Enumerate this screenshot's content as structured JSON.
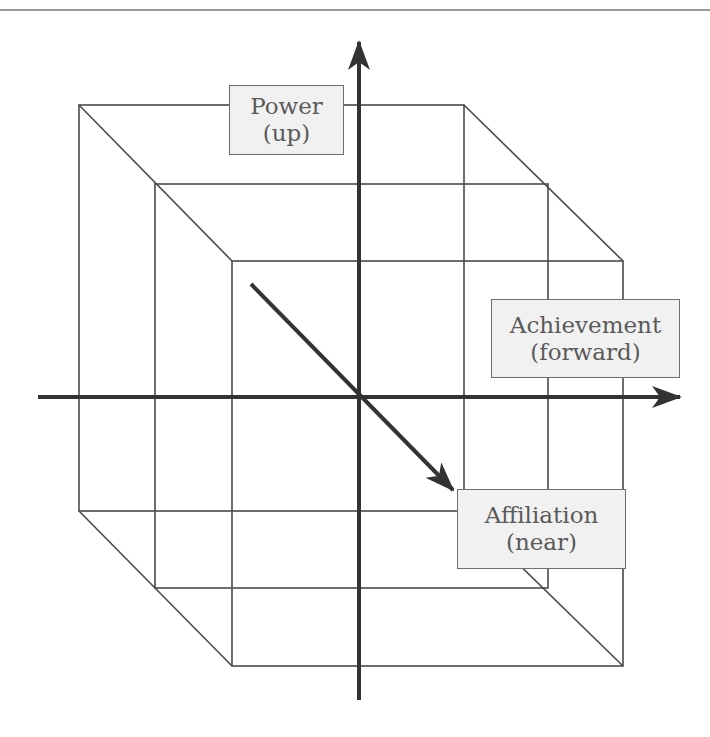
{
  "header": {
    "text": ""
  },
  "diagram": {
    "title": "",
    "axes": [
      {
        "id": "power",
        "label": "Power",
        "direction": "(up)"
      },
      {
        "id": "achievement",
        "label": "Achievement",
        "direction": "(forward)"
      },
      {
        "id": "affiliation",
        "label": "Affiliation",
        "direction": "(near)"
      }
    ],
    "colors": {
      "line": "#4a4a4a",
      "axis": "#333333",
      "box_fill": "#f1f1f1",
      "box_border": "#6e6e6e",
      "text": "#5a5a5a"
    }
  }
}
